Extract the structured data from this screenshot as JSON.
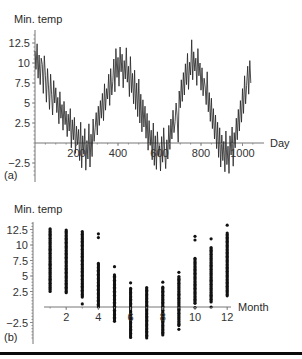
{
  "chart_data": [
    {
      "id": "a",
      "type": "line",
      "panel_label": "(a)",
      "title": "",
      "ylabel": "Min. temp",
      "xlabel": "Day",
      "xlim": [
        0,
        1100
      ],
      "ylim": [
        -4.5,
        14
      ],
      "xticks": [
        200,
        400,
        600,
        800,
        1000
      ],
      "xtick_labels": [
        "200",
        "400",
        "600",
        "800",
        "1000"
      ],
      "yticks": [
        -2.5,
        2.5,
        5,
        7.5,
        10,
        12.5
      ],
      "ytick_labels": [
        "−2.5",
        "2.5",
        "5",
        "7.5",
        "10",
        "12.5"
      ],
      "grid": false,
      "series": [
        {
          "name": "Min. temp",
          "x_start": 0,
          "x_step": 5,
          "values": [
            11.5,
            9.2,
            12.4,
            8.1,
            11.0,
            7.3,
            10.6,
            9.8,
            6.2,
            10.9,
            8.4,
            5.1,
            9.3,
            7.0,
            4.2,
            8.6,
            6.1,
            3.5,
            7.8,
            5.0,
            6.9,
            3.8,
            5.7,
            2.4,
            6.4,
            3.1,
            4.8,
            1.6,
            5.2,
            2.3,
            4.0,
            0.8,
            3.6,
            1.5,
            4.3,
            -0.6,
            2.9,
            0.4,
            3.2,
            -1.3,
            2.1,
            -0.2,
            1.7,
            -2.2,
            2.6,
            -3.1,
            0.9,
            -1.4,
            1.8,
            -3.4,
            0.3,
            -2.0,
            2.4,
            -3.0,
            1.1,
            -1.7,
            3.0,
            0.2,
            1.9,
            3.8,
            1.0,
            4.6,
            2.2,
            5.3,
            3.1,
            6.2,
            2.8,
            7.4,
            4.1,
            6.8,
            5.5,
            8.6,
            4.7,
            9.3,
            6.0,
            7.7,
            10.5,
            6.4,
            11.8,
            8.2,
            10.7,
            7.1,
            12.0,
            8.9,
            11.1,
            6.9,
            10.3,
            8.0,
            11.9,
            7.6,
            9.6,
            5.8,
            10.8,
            6.3,
            8.7,
            4.9,
            9.1,
            4.2,
            7.5,
            3.3,
            8.0,
            2.5,
            6.1,
            1.4,
            5.4,
            2.0,
            4.6,
            0.6,
            3.7,
            -0.9,
            2.8,
            -0.3,
            1.6,
            -2.1,
            2.5,
            -2.8,
            0.9,
            -3.3,
            1.4,
            -1.6,
            -0.2,
            -3.5,
            0.8,
            -2.4,
            1.9,
            -1.1,
            -3.2,
            0.4,
            -2.0,
            2.2,
            -0.8,
            3.0,
            0.5,
            4.1,
            1.3,
            2.7,
            5.0,
            3.4,
            0.1,
            6.5,
            4.4,
            7.9,
            5.2,
            8.8,
            6.0,
            9.9,
            7.3,
            11.2,
            6.7,
            10.1,
            8.5,
            12.9,
            7.9,
            11.4,
            9.0,
            10.6,
            7.2,
            11.8,
            8.4,
            10.0,
            6.6,
            9.4,
            5.9,
            8.1,
            7.0,
            4.8,
            8.9,
            3.9,
            6.3,
            2.7,
            5.6,
            1.8,
            4.3,
            0.5,
            3.5,
            -0.7,
            2.6,
            -1.8,
            1.9,
            -3.0,
            1.0,
            -2.2,
            0.2,
            -3.6,
            1.5,
            -2.7,
            -0.4,
            -3.8,
            0.9,
            -1.5,
            2.0,
            -2.9,
            1.3,
            -0.6,
            3.1,
            0.4,
            4.2,
            1.5,
            5.3,
            2.6,
            6.8,
            3.7,
            8.4,
            4.9,
            7.2,
            9.6,
            6.1,
            10.3,
            7.5
          ],
          "color": "#222222"
        }
      ]
    },
    {
      "id": "b",
      "type": "scatter",
      "panel_label": "(b)",
      "title": "",
      "ylabel": "Min. temp",
      "xlabel": "Month",
      "xlim": [
        0.3,
        12.5
      ],
      "ylim": [
        -5.2,
        13.5
      ],
      "xticks": [
        2,
        4,
        6,
        8,
        10,
        12
      ],
      "xtick_labels": [
        "2",
        "4",
        "6",
        "8",
        "10",
        "12"
      ],
      "yticks": [
        -2.5,
        2.5,
        5,
        7.5,
        10,
        12.5
      ],
      "ytick_labels": [
        "−2.5",
        "2.5",
        "5",
        "7.5",
        "10",
        "12.5"
      ],
      "grid": false,
      "months": [
        {
          "month": 1,
          "min": 2.5,
          "max": 12.7,
          "outliers": []
        },
        {
          "month": 2,
          "min": 2.3,
          "max": 12.5,
          "outliers": []
        },
        {
          "month": 3,
          "min": 1.6,
          "max": 12.2,
          "outliers": [
            0.5
          ]
        },
        {
          "month": 4,
          "min": 0.0,
          "max": 7.2,
          "outliers": [
            11.8,
            11.2
          ]
        },
        {
          "month": 5,
          "min": -2.3,
          "max": 5.2,
          "outliers": [
            6.5
          ]
        },
        {
          "month": 6,
          "min": -4.9,
          "max": 3.2,
          "outliers": [
            3.9
          ]
        },
        {
          "month": 7,
          "min": -5.0,
          "max": 3.2,
          "outliers": []
        },
        {
          "month": 8,
          "min": -4.5,
          "max": 3.2,
          "outliers": [
            4.0
          ]
        },
        {
          "month": 9,
          "min": -3.0,
          "max": 5.0,
          "outliers": [
            5.6,
            -3.6
          ]
        },
        {
          "month": 10,
          "min": 0.6,
          "max": 8.0,
          "outliers": [
            11.4,
            10.8,
            -0.1
          ]
        },
        {
          "month": 11,
          "min": 0.8,
          "max": 9.6,
          "outliers": [
            11.0,
            0.0
          ]
        },
        {
          "month": 12,
          "min": 1.8,
          "max": 12.1,
          "outliers": [
            13.2
          ]
        }
      ],
      "color": "#111111"
    }
  ]
}
